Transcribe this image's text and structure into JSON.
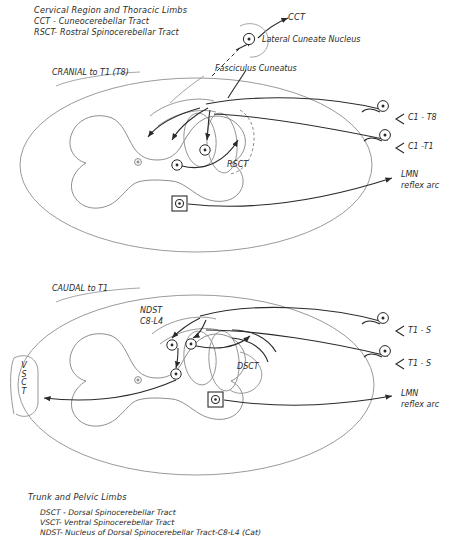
{
  "figure": {
    "title_top": "Cervical Region and Thoracic Limbs",
    "title_bottom": "Trunk and Pelvic Limbs"
  },
  "legend_top": {
    "items": [
      "CCT  - Cuneocerebellar Tract",
      "RSCT- Rostral Spinocerebellar Tract"
    ]
  },
  "legend_bottom": {
    "items": [
      "DSCT - Dorsal Spinocerebellar Tract",
      "VSCT- Ventral Spinocerebellar Tract",
      "NDST- Nucleus of Dorsal Spinocerebellar Tract-C8-L4 (Cat)"
    ]
  },
  "top_panel": {
    "section_label": "CRANIAL to T1 (T8)",
    "cct_label": "CCT",
    "lateral_cuneate_nucleus": "Lateral Cuneate Nucleus",
    "fasciculus_cuneatus": "Fasciculus Cuneatus",
    "rsct_label": "RSCT",
    "right_labels": [
      "C1 - T8",
      "C1 -T1"
    ],
    "lmn_label_line1": "LMN",
    "lmn_label_line2": "reflex arc"
  },
  "bottom_panel": {
    "section_label": "CAUDAL to T1",
    "ndst_line1": "NDST",
    "ndst_line2": "C8-L4",
    "dsct_label": "DSCT",
    "vsct_letters": [
      "V",
      "S",
      "C",
      "T"
    ],
    "right_labels": [
      "T1 - S",
      "T1 - S"
    ],
    "lmn_label_line1": "LMN",
    "lmn_label_line2": "reflex arc"
  },
  "colors": {
    "ink": "#2a2a2a",
    "outline": "#8d8d8d",
    "grey_structure": "#9a9a9a",
    "background": "#ffffff"
  }
}
